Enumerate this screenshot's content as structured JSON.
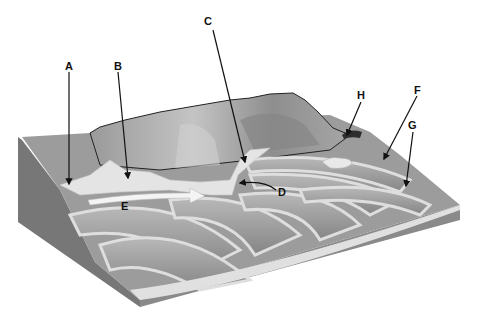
{
  "diagram": {
    "type": "glacial landscape block diagram",
    "labels": [
      {
        "id": "A",
        "text": "A"
      },
      {
        "id": "B",
        "text": "B"
      },
      {
        "id": "C",
        "text": "C"
      },
      {
        "id": "D",
        "text": "D"
      },
      {
        "id": "E",
        "text": "E"
      },
      {
        "id": "F",
        "text": "F"
      },
      {
        "id": "G",
        "text": "G"
      },
      {
        "id": "H",
        "text": "H"
      }
    ],
    "colors": {
      "background": "#ffffff",
      "mountain": "#a8a8a8",
      "mountain_shade": "#8a8a8a",
      "ridge": "#8c8c8c",
      "ridge_light": "#b4b4b4",
      "channel": "#e2e2e2",
      "side_face": "#7a7a7a",
      "front_face": "#8e8e8e",
      "outline": "#222222",
      "arrow_line": "#111111",
      "flow_arrow": "#f4f4f4"
    }
  }
}
